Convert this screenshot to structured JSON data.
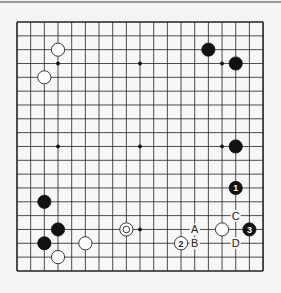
{
  "board": {
    "size": 19,
    "origin_x": 17,
    "origin_y": 22,
    "step_x": 13.67,
    "step_y": 13.83,
    "line_color": "#222222",
    "background": "#f7f7f7"
  },
  "star_points": [
    [
      3,
      3
    ],
    [
      9,
      3
    ],
    [
      15,
      3
    ],
    [
      3,
      9
    ],
    [
      9,
      9
    ],
    [
      15,
      9
    ],
    [
      3,
      15
    ],
    [
      9,
      15
    ],
    [
      15,
      15
    ]
  ],
  "stones": [
    {
      "color": "white",
      "col": 3,
      "row": 2
    },
    {
      "color": "white",
      "col": 2,
      "row": 4
    },
    {
      "color": "black",
      "col": 14,
      "row": 2
    },
    {
      "color": "black",
      "col": 16,
      "row": 3
    },
    {
      "color": "black",
      "col": 16,
      "row": 9
    },
    {
      "color": "black",
      "col": 16,
      "row": 12,
      "label": "1"
    },
    {
      "color": "white",
      "col": 12,
      "row": 16,
      "label": "2"
    },
    {
      "color": "black",
      "col": 17,
      "row": 15,
      "label": "3"
    },
    {
      "color": "white",
      "col": 15,
      "row": 15
    },
    {
      "color": "black",
      "col": 2,
      "row": 13
    },
    {
      "color": "black",
      "col": 3,
      "row": 15
    },
    {
      "color": "black",
      "col": 2,
      "row": 16
    },
    {
      "color": "white",
      "col": 5,
      "row": 16
    },
    {
      "color": "white",
      "col": 3,
      "row": 17
    },
    {
      "color": "white-marked",
      "col": 8,
      "row": 15
    }
  ],
  "letters": [
    {
      "text": "A",
      "col": 13,
      "row": 15
    },
    {
      "text": "B",
      "col": 13,
      "row": 16
    },
    {
      "text": "C",
      "col": 16,
      "row": 14
    },
    {
      "text": "D",
      "col": 16,
      "row": 16
    }
  ]
}
